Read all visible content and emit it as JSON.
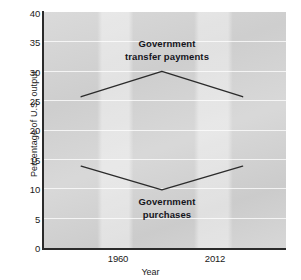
{
  "chart_data": {
    "type": "line",
    "title": "",
    "xlabel": "Year",
    "ylabel": "Percentage of U.S. output",
    "x": [
      1960,
      1986,
      2012
    ],
    "xtick_labels": [
      "1960",
      "2012"
    ],
    "xlim": [
      1948,
      2026
    ],
    "ylim": [
      0,
      40
    ],
    "ytick_labels": [
      "0",
      "5",
      "10",
      "15",
      "20",
      "25",
      "30",
      "35",
      "40"
    ],
    "yticks": [
      0,
      5,
      10,
      15,
      20,
      25,
      30,
      35,
      40
    ],
    "grid": true,
    "legend_position": "inline-annotations",
    "line_color": "#2b2b2b",
    "plot_background": "#d2d2d2",
    "series": [
      {
        "name": "Government transfer payments",
        "values": [
          25.7,
          30.0,
          25.7
        ],
        "annotation": "Government\ntransfer payments"
      },
      {
        "name": "Government purchases",
        "values": [
          14.0,
          10.0,
          14.0
        ],
        "annotation": "Government\npurchases"
      }
    ]
  }
}
